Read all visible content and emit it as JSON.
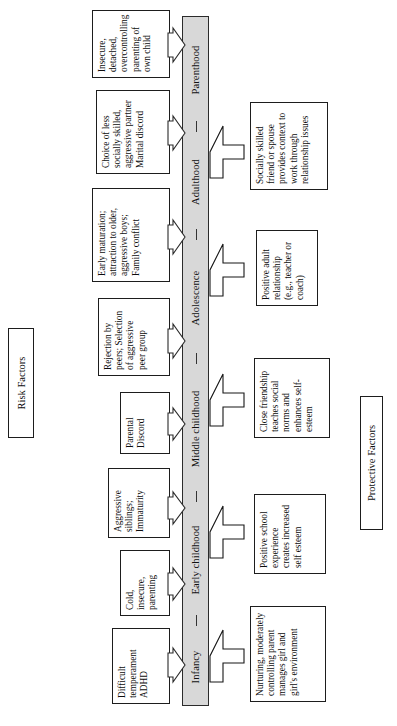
{
  "figure": {
    "risk_section_label": "Risk Factors",
    "protective_section_label": "Protective Factors"
  },
  "timeline": {
    "stages": [
      {
        "label": "Infancy"
      },
      {
        "label": "Early childhood"
      },
      {
        "label": "Middle childhood"
      },
      {
        "label": "Adolescence"
      },
      {
        "label": "Adulthood"
      },
      {
        "label": "Parenthood"
      }
    ]
  },
  "risk_factors": [
    {
      "stage": "Infancy",
      "text": "Difficult temperament ADHD"
    },
    {
      "stage": "Early childhood",
      "text": "Cold, insecure, parenting"
    },
    {
      "stage": "Early childhood",
      "text": "Aggressive siblings; Immaturity"
    },
    {
      "stage": "Middle childhood",
      "text": "Parental Discord"
    },
    {
      "stage": "Middle childhood",
      "text": "Rejection by peers; Selection of aggressive peer group"
    },
    {
      "stage": "Adolescence",
      "text": "Early maturation; attraction to older, aggressive boys; Family conflict"
    },
    {
      "stage": "Adulthood",
      "text": "Choice of less socially skilled, aggressive partner Marital discord"
    },
    {
      "stage": "Parenthood",
      "text": "Insecure, detached, overcontrolling parenting of own child"
    }
  ],
  "protective_factors": [
    {
      "stage": "Infancy",
      "text": "Nurturing, moderately controlling parent manages girl and girl's environment"
    },
    {
      "stage": "Early childhood",
      "text": "Positive school experience creates increased self esteem"
    },
    {
      "stage": "Middle childhood",
      "text": "Close friendship teaches social norms and enhances self-esteem"
    },
    {
      "stage": "Adolescence",
      "text": "Positive adult relationship (e.g., teacher or coach)"
    },
    {
      "stage": "Adulthood",
      "text": "Socially skilled friend or spouse provides context to work through relationship issues"
    }
  ]
}
